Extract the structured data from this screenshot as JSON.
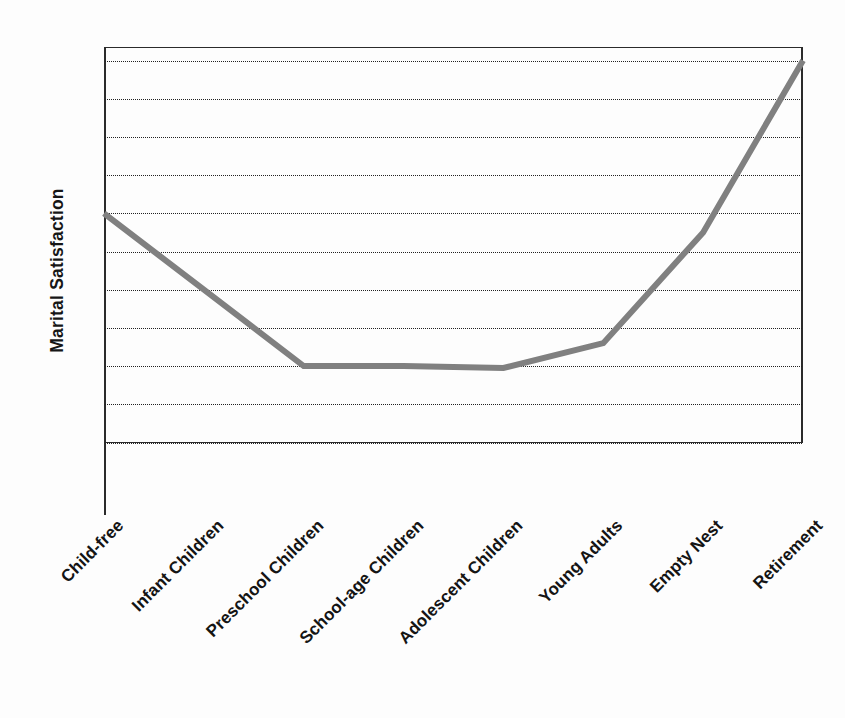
{
  "chart_data": {
    "type": "line",
    "title": "",
    "subtitle": "",
    "xlabel": "",
    "ylabel": "Marital Satisfaction",
    "categories": [
      "Child-free",
      "Infant Children",
      "Preschool Children",
      "School-age Children",
      "Adolescent Children",
      "Young Adults",
      "Empty Nest",
      "Retirement"
    ],
    "series": [
      {
        "name": "Marital Satisfaction",
        "color": "#808080",
        "values": [
          7,
          5,
          3,
          3,
          2.95,
          3.6,
          6.5,
          11
        ]
      }
    ],
    "x": [
      0,
      1,
      2,
      3,
      4,
      5,
      6,
      7
    ],
    "ylim": [
      0,
      12
    ],
    "xlim": [
      0,
      7
    ],
    "yticks": [
      1,
      2,
      3,
      4,
      5,
      6,
      7,
      8,
      9,
      10,
      11
    ],
    "ytick_labels": [
      "",
      "",
      "",
      "",
      "",
      "",
      "",
      "",
      "",
      "",
      ""
    ],
    "grid": "horizontal-dotted",
    "grid_count": 11,
    "legend": "none",
    "axis_color": "#2b2b2b",
    "grid_color": "#222222",
    "line_width": 6,
    "annotations": []
  },
  "figure": {
    "background": "#fdfdfd",
    "y_axis_title": "Marital Satisfaction",
    "x_tick_rotation": 45
  }
}
